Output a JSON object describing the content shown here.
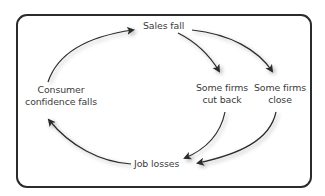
{
  "diagram": {
    "type": "cycle",
    "nodes": {
      "sales_fall": {
        "lines": [
          "Sales fall"
        ]
      },
      "firms_cut_back": {
        "lines": [
          "Some firms",
          "cut back"
        ]
      },
      "firms_close": {
        "lines": [
          "Some firms",
          "close"
        ]
      },
      "job_losses": {
        "lines": [
          "Job losses"
        ]
      },
      "consumer_confidence": {
        "lines": [
          "Consumer",
          "confidence falls"
        ]
      }
    },
    "edges": [
      {
        "from": "Consumer confidence falls",
        "to": "Sales fall"
      },
      {
        "from": "Sales fall",
        "to": "Some firms cut back"
      },
      {
        "from": "Sales fall",
        "to": "Some firms close"
      },
      {
        "from": "Some firms cut back",
        "to": "Job losses"
      },
      {
        "from": "Some firms close",
        "to": "Job losses"
      },
      {
        "from": "Job losses",
        "to": "Consumer confidence falls"
      }
    ],
    "colors": {
      "border": "#2b2b2b",
      "arrow": "#2a2a2a",
      "text": "#3b3b3b",
      "background": "#ffffff"
    }
  }
}
